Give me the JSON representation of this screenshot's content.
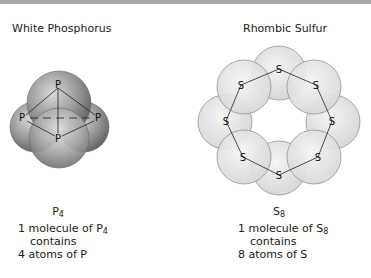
{
  "left_panel": {
    "title": "White Phosphorus",
    "formula_element": "P",
    "formula_subscript": "4",
    "atom_label": "P",
    "caption": {
      "line1_prefix": "1 molecule of ",
      "line1_element": "P",
      "line1_subscript": "4",
      "line2": "contains",
      "line3": "4 atoms of P"
    }
  },
  "right_panel": {
    "title": "Rhombic Sulfur",
    "formula_element": "S",
    "formula_subscript": "8",
    "atom_label": "S",
    "caption": {
      "line1_prefix": "1 molecule of ",
      "line1_element": "S",
      "line1_subscript": "8",
      "line2": "contains",
      "line3": "8 atoms of S"
    }
  },
  "colors": {
    "top_bar": "#a8a8a8",
    "phosphorus_sphere": "#8c8c8c",
    "sulfur_sphere": "#e6e6e6"
  }
}
